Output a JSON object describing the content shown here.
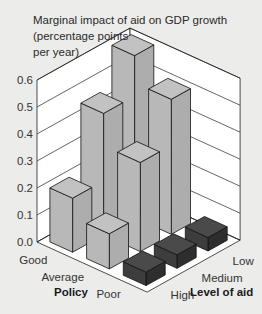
{
  "chart_data": {
    "type": "bar",
    "subtype": "3d-bar",
    "title": "Marginal impact of aid on GDP growth (percentage points per year)",
    "title_lines": [
      "Marginal impact of aid on GDP growth",
      "(percentage points",
      "per year)"
    ],
    "xlabel": "Policy",
    "ylabel": "Level of aid",
    "zlabel": "Marginal impact of aid on GDP growth (percentage points per year)",
    "x_categories": [
      "Good",
      "Average",
      "Poor"
    ],
    "y_categories": [
      "High",
      "Medium",
      "Low"
    ],
    "zlim": [
      0,
      0.6
    ],
    "z_ticks": [
      "0.0",
      "0.1",
      "0.2",
      "0.3",
      "0.4",
      "0.5",
      "0.6"
    ],
    "grid": true,
    "series": [
      {
        "name": "Good",
        "values": {
          "High": 0.2,
          "Medium": 0.45,
          "Low": 0.6
        }
      },
      {
        "name": "Average",
        "values": {
          "High": 0.13,
          "Medium": 0.33,
          "Low": 0.5
        }
      },
      {
        "name": "Poor",
        "values": {
          "High": 0.05,
          "Medium": 0.05,
          "Low": 0.05
        }
      }
    ],
    "colors": {
      "positive": "#b5b5b5",
      "poor": "#3a3a3a",
      "background": "#ececeb",
      "wall": "#ffffff"
    }
  }
}
